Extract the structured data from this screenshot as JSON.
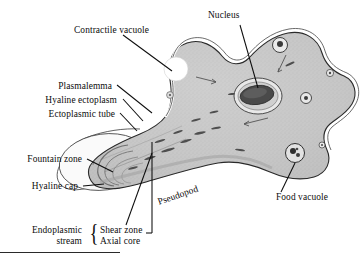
{
  "figure": {
    "labels": {
      "contractile_vacuole": "Contractile vacuole",
      "nucleus": "Nucleus",
      "plasmalemma": "Plasmalemma",
      "hyaline_ectoplasm": "Hyaline ectoplasm",
      "ectoplasmic_tube": "Ectoplasmic tube",
      "fountain_zone": "Fountain zone",
      "hyaline_cap": "Hyaline cap",
      "pseudopod": "Pseudopod",
      "food_vacuole": "Food vacuole",
      "endoplasmic_line1": "Endoplasmic",
      "endoplasmic_line2": "stream",
      "shear_zone": "Shear zone",
      "axial_core": "Axial core",
      "brace": "{"
    },
    "colors": {
      "ink": "#0d0d0d",
      "cytoplasm": "#c9c9c9",
      "cytoplasm_dark": "#b0b0b0",
      "hyaline": "#f4f4f4",
      "nucleus_dark": "#3b3b3b",
      "vacuole_white": "#ffffff",
      "outline": "#2a2a2a"
    }
  }
}
